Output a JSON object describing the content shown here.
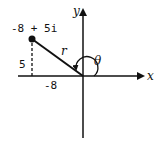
{
  "diagram": {
    "type": "complex-plane",
    "point_label": "-8 + 5i",
    "real_part": "-8",
    "imag_part": "5",
    "modulus_label": "r",
    "angle_label": "θ",
    "x_axis_label": "x",
    "y_axis_label": "y",
    "colors": {
      "stroke": "#111111",
      "background": "#ffffff"
    }
  }
}
